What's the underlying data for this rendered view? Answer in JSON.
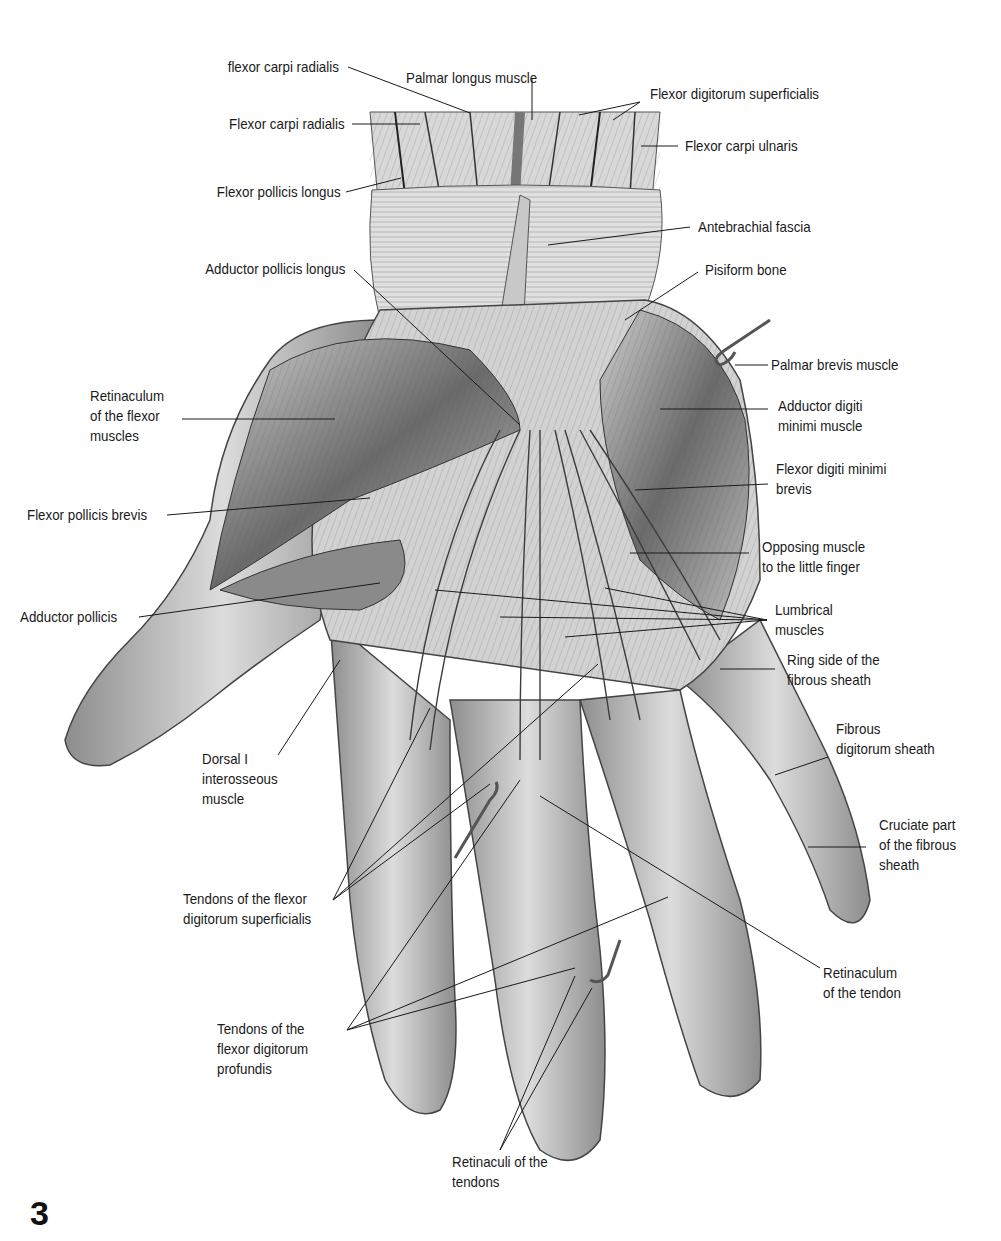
{
  "figure": {
    "number": "3",
    "colors": {
      "background": "#ffffff",
      "text": "#1a1a1a",
      "illustration_mid": "#9a9a9a",
      "illustration_dark": "#3c3c3c",
      "illustration_light": "#e4e4e4"
    }
  },
  "labels": [
    {
      "id": "flexor-carpi-radialis-top",
      "text": "flexor carpi radialis"
    },
    {
      "id": "palmar-longus",
      "text": "Palmar longus muscle"
    },
    {
      "id": "flexor-digitorum-superficialis",
      "text": "Flexor digitorum superficialis"
    },
    {
      "id": "flexor-carpi-radialis",
      "text": "Flexor carpi radialis"
    },
    {
      "id": "flexor-carpi-ulnaris",
      "text": "Flexor carpi ulnaris"
    },
    {
      "id": "flexor-pollicis-longus",
      "text": "Flexor pollicis longus"
    },
    {
      "id": "antebrachial-fascia",
      "text": "Antebrachial fascia"
    },
    {
      "id": "adductor-pollicis-longus",
      "text": "Adductor pollicis longus"
    },
    {
      "id": "pisiform-bone",
      "text": "Pisiform bone"
    },
    {
      "id": "palmar-brevis",
      "text": "Palmar brevis muscle"
    },
    {
      "id": "retinaculum-flexor",
      "text": "Retinaculum\nof the flexor\nmuscles"
    },
    {
      "id": "adductor-digiti-minimi",
      "text": "Adductor digiti\nminimi muscle"
    },
    {
      "id": "flexor-digiti-minimi-brevis",
      "text": "Flexor digiti minimi\nbrevis"
    },
    {
      "id": "flexor-pollicis-brevis",
      "text": "Flexor pollicis brevis"
    },
    {
      "id": "opposing-muscle",
      "text": "Opposing muscle\nto the little finger"
    },
    {
      "id": "adductor-pollicis",
      "text": "Adductor pollicis"
    },
    {
      "id": "lumbrical-muscles",
      "text": "Lumbrical\nmuscles"
    },
    {
      "id": "ring-side-sheath",
      "text": "Ring side of the\nfibrous sheath"
    },
    {
      "id": "fibrous-digitorum-sheath",
      "text": "Fibrous\ndigitorum sheath"
    },
    {
      "id": "dorsal-interosseous",
      "text": "Dorsal I\ninterosseous\nmuscle"
    },
    {
      "id": "cruciate-part",
      "text": "Cruciate part\nof the fibrous\nsheath"
    },
    {
      "id": "tendons-fds",
      "text": "Tendons of the flexor\ndigitorum superficialis"
    },
    {
      "id": "retinaculum-tendon",
      "text": "Retinaculum\nof the tendon"
    },
    {
      "id": "tendons-fdp",
      "text": "Tendons of the\nflexor digitorum\nprofundis"
    },
    {
      "id": "retinaculi-tendons",
      "text": "Retinaculi of the\ntendons"
    }
  ]
}
